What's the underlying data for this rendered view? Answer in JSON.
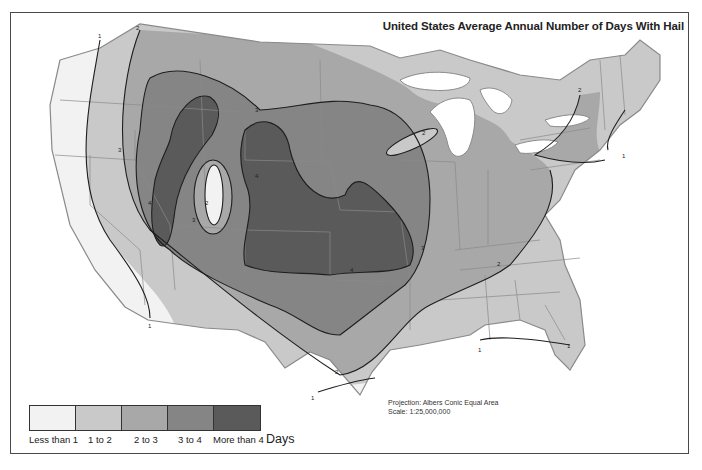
{
  "title": "United States Average Annual Number of Days With Hail",
  "projection": {
    "line1": "Projection: Albers Conic Equal Area",
    "line2": "Scale: 1:25,000,000"
  },
  "legend": {
    "unit": "Days",
    "items": [
      {
        "label": "Less than 1",
        "color": "#f2f2f2"
      },
      {
        "label": "1 to 2",
        "color": "#c9c9c9"
      },
      {
        "label": "2 to 3",
        "color": "#a8a8a8"
      },
      {
        "label": "3 to 4",
        "color": "#858585"
      },
      {
        "label": "More than 4",
        "color": "#5a5a5a"
      }
    ]
  },
  "contour_labels": [
    "1",
    "2",
    "3",
    "4"
  ],
  "colors": {
    "frame": "#4a4a4a",
    "state_border": "#8a8a8a",
    "contour_line": "#1e1e1e",
    "water": "#ffffff"
  }
}
